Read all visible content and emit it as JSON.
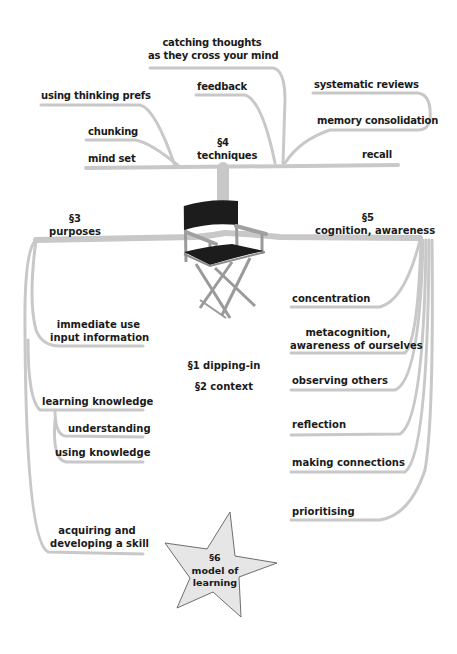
{
  "diagram": {
    "type": "mind-map",
    "center": {
      "icon": "director-chair-icon",
      "labels": [
        "§1 dipping-in",
        "§2 context"
      ]
    },
    "colors": {
      "branch": "#c8c8c8",
      "branch_shadow": "#a9a9a9",
      "text": "#1a1a1a",
      "star_fill": "#e6e6e6",
      "star_stroke": "#6e6e6e",
      "chair_fabric": "#1c1c1c",
      "chair_frame": "#9a9a9a"
    },
    "techniques": {
      "section": "§4",
      "title": "techniques",
      "items": [
        {
          "line1": "catching thoughts",
          "line2": "as they cross your mind"
        },
        {
          "line1": "feedback"
        },
        {
          "line1": "using thinking prefs"
        },
        {
          "line1": "chunking"
        },
        {
          "line1": "mind set"
        },
        {
          "line1": "systematic reviews"
        },
        {
          "line1": "memory consolidation"
        },
        {
          "line1": "recall"
        }
      ]
    },
    "purposes": {
      "section": "§3",
      "title": "purposes",
      "items": [
        {
          "line1": "immediate use",
          "line2": "input information"
        },
        {
          "line1": "learning knowledge"
        },
        {
          "line1": "understanding"
        },
        {
          "line1": "using knowledge"
        },
        {
          "line1": "acquiring and",
          "line2": "developing a skill"
        }
      ]
    },
    "cognition": {
      "section": "§5",
      "title": "cognition, awareness",
      "items": [
        {
          "line1": "concentration"
        },
        {
          "line1": "metacognition,",
          "line2": "awareness of ourselves"
        },
        {
          "line1": "observing others"
        },
        {
          "line1": "reflection"
        },
        {
          "line1": "making connections"
        },
        {
          "line1": "prioritising"
        }
      ]
    },
    "model": {
      "section": "§6",
      "line1": "model of",
      "line2": "learning"
    }
  }
}
